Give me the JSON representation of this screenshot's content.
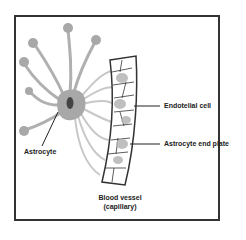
{
  "diagram": {
    "labels": {
      "endothelial_cell": "Endotelial cell",
      "astrocyte_end_plate": "Astrocyte end plate",
      "astrocyte": "Astrocyte",
      "blood_vessel_line1": "Blood vessel",
      "blood_vessel_line2": "(capillary)"
    },
    "colors": {
      "frame": "#333333",
      "astrocyte_fill": "#a8a8a8",
      "nucleus": "#444444",
      "vessel_outline": "#333333",
      "endfoot_fill": "#b5b5b5",
      "leader_line": "#222222"
    }
  }
}
